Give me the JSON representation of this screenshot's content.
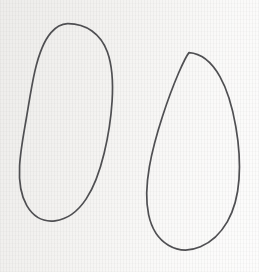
{
  "canvas": {
    "width": 259,
    "height": 272,
    "background_color": "#f5f4f2",
    "texture": "vertical-scanline-paper",
    "title": "Two hand-drawn closed oval outlines"
  },
  "style": {
    "stroke_color": "#4f4f52",
    "stroke_width": 1.7,
    "fill": "none"
  },
  "shapes": [
    {
      "name": "left-oval",
      "label": "Left oval outline",
      "bbox": {
        "x": 20,
        "y": 23,
        "width": 92,
        "height": 199
      },
      "center": {
        "x": 66,
        "y": 122
      },
      "rx": 46,
      "ry": 99,
      "rotation_deg": -4,
      "path": "M 67.5 23.6 C 86.0 23.4 101.0 34.0 107.4 52.0 C 112.6 66.6 113.2 83.5 112.1 101.0 C 111.0 118.6 108.2 136.5 104.2 153.0 C 100.0 170.4 94.4 186.6 86.2 198.9 C 78.0 211.3 67.2 219.3 55.0 220.8 C 43.2 222.2 33.2 216.4 26.8 205.6 C 20.6 195.0 18.8 181.0 19.6 166.0 C 20.4 150.6 23.6 134.4 26.4 118.0 C 29.2 101.6 31.6 85.2 35.0 70.6 C 38.6 55.2 43.4 41.4 51.0 32.6 C 55.8 27.0 61.2 23.8 67.5 23.6 Z"
    },
    {
      "name": "right-oval",
      "label": "Right oval outline (egg shape)",
      "bbox": {
        "x": 148,
        "y": 52,
        "width": 92,
        "height": 199
      },
      "center": {
        "x": 194,
        "y": 151
      },
      "rx": 46,
      "ry": 99,
      "rotation_deg": 2,
      "path": "M 189.0 52.6 C 201.0 53.4 211.8 62.2 219.8 76.4 C 227.6 90.2 232.6 108.2 235.8 126.6 C 239.0 145.0 240.2 163.2 239.0 179.4 C 237.8 195.8 234.0 210.0 227.4 221.6 C 220.6 233.4 211.2 242.2 200.4 246.8 C 189.6 251.4 178.2 251.0 168.4 245.2 C 158.6 239.4 151.6 228.6 148.6 214.6 C 145.6 200.6 146.4 183.8 149.4 166.6 C 152.4 149.4 157.4 132.0 162.6 116.0 C 167.8 100.0 173.2 85.6 178.6 73.0 C 182.4 64.2 185.6 56.8 189.0 52.6 Z"
    }
  ]
}
